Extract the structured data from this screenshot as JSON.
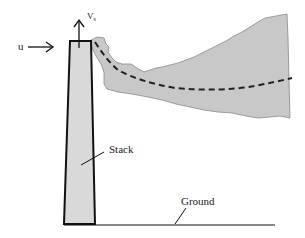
{
  "diagram": {
    "labels": {
      "wind": "u",
      "exit_velocity": "V",
      "exit_velocity_sub": "s",
      "stack": "Stack",
      "ground": "Ground"
    },
    "colors": {
      "plume_fill": "#c8c8c8",
      "stack_fill": "#d9d9d9",
      "stroke": "#111111"
    }
  }
}
